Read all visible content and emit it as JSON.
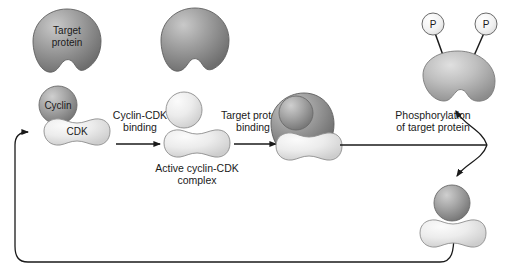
{
  "diagram": {
    "background_color": "#ffffff",
    "colors": {
      "target_protein_dark": "#8f8f8f",
      "cyclin_medium": "#9a9a9a",
      "cdk_light": "#e3e3e3",
      "phospho_protein": "#b5b5b5",
      "outline": "#4a4a4a",
      "arrow": "#1a1a1a",
      "text": "#1a1a1a"
    },
    "shapes": {
      "target_protein_left": {
        "label": "Target\nprotein",
        "label_line1": "Target",
        "label_line2": "protein"
      },
      "target_protein_top": {
        "label": ""
      },
      "cyclin": {
        "label": "Cyclin"
      },
      "cdk": {
        "label": "CDK"
      },
      "phosphate_1": {
        "label": "P"
      },
      "phosphate_2": {
        "label": "P"
      }
    },
    "step_labels": {
      "binding_cyclin_cdk_line1": "Cyclin-CDK",
      "binding_cyclin_cdk_line2": "binding",
      "binding_target_line1": "Target protein",
      "binding_target_line2": "binding",
      "phosphorylation_line1": "Phosphorylation",
      "phosphorylation_line2": "of target protein"
    },
    "captions": {
      "active_complex_line1": "Active cyclin-CDK",
      "active_complex_line2": "complex"
    }
  }
}
